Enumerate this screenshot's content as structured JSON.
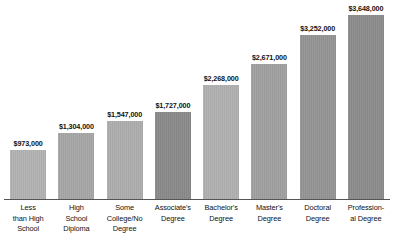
{
  "chart_data": {
    "type": "bar",
    "title": "",
    "subtitle": "",
    "xlabel": "",
    "ylabel": "",
    "grid": false,
    "legend": false,
    "ylim": [
      0,
      3648000
    ],
    "categories": [
      "Less than High School",
      "High School Diploma",
      "Some College/No Degree",
      "Associate's Degree",
      "Bachelor's Degree",
      "Master's Degree",
      "Doctoral Degree",
      "Profession-al Degree"
    ],
    "category_lines": [
      [
        "Less",
        "than High",
        "School"
      ],
      [
        "High",
        "School",
        "Diploma"
      ],
      [
        "Some",
        "College/No",
        "Degree"
      ],
      [
        "Associate's",
        "Degree"
      ],
      [
        "Bachelor's",
        "Degree"
      ],
      [
        "Master's",
        "Degree"
      ],
      [
        "Doctoral",
        "Degree"
      ],
      [
        "Profession-",
        "al Degree"
      ]
    ],
    "values": [
      973000,
      1304000,
      1547000,
      1727000,
      2268000,
      2671000,
      3252000,
      3648000
    ],
    "value_labels": [
      "$973,000",
      "$1,304,000",
      "$1,547,000",
      "$1,727,000",
      "$2,268,000",
      "$2,671,000",
      "$3,252,000",
      "$3,648,000"
    ],
    "bar_colors": [
      "#b2b2b2",
      "#a6a6a6",
      "#adadad",
      "#8a8a8a",
      "#b0b0b0",
      "#a0a0a0",
      "#949494",
      "#8c8c8c"
    ],
    "axis_color": "#555555"
  }
}
